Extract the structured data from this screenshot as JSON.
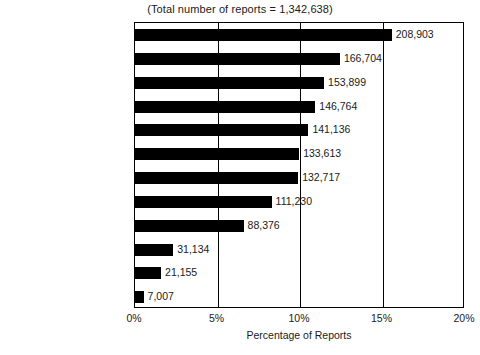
{
  "chart_data": {
    "type": "bar",
    "orientation": "horizontal",
    "title": "(Total number of reports = 1,342,638)",
    "xlabel": "Percentage of Reports",
    "ylabel": "",
    "total_reports": 1342638,
    "xlim": [
      0,
      20
    ],
    "xticks": [
      "0%",
      "5%",
      "10%",
      "15%",
      "20%"
    ],
    "xtick_values": [
      0,
      5,
      10,
      15,
      20
    ],
    "grid": true,
    "legend": "none",
    "categories": [
      "Education",
      "Social Services",
      "Legal/Justice",
      "Anonymous Reporters",
      "Medical",
      "Friends/Neighbors",
      "Other Relatives",
      "Other",
      "Parents",
      "Victims",
      "Child Care Providers",
      "Perpetrator"
    ],
    "values": [
      208903,
      166704,
      153899,
      146764,
      141136,
      133613,
      132717,
      111230,
      88376,
      31134,
      21155,
      7007
    ],
    "value_labels": [
      "208,903",
      "166,704",
      "153,899",
      "146,764",
      "141,136",
      "133,613",
      "132,717",
      "111,230",
      "88,376",
      "31,134",
      "21,155",
      "7,007"
    ],
    "percentages": [
      15.56,
      12.42,
      11.46,
      10.93,
      10.51,
      9.95,
      9.89,
      8.28,
      6.58,
      2.32,
      1.58,
      0.52
    ],
    "bar_color": "#000000",
    "axis_color": "#000000",
    "background_color": "#ffffff"
  }
}
